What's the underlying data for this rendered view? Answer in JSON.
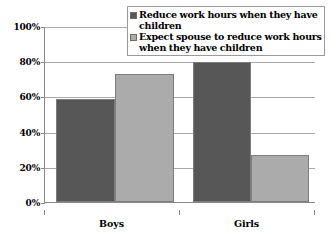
{
  "chart_data": {
    "type": "bar",
    "title": "",
    "subtitle": "",
    "xlabel": "",
    "ylabel": "",
    "categories": [
      "Boys",
      "Girls"
    ],
    "ylim": [
      0,
      100
    ],
    "ytick_labels": [
      "100%",
      "80%",
      "60%",
      "40%",
      "20%",
      "0%"
    ],
    "ytick_values": [
      100,
      80,
      60,
      40,
      20,
      0
    ],
    "grid": true,
    "legend_position": "top-right",
    "series": [
      {
        "name": "Reduce work hours when they have children",
        "color": "#575757",
        "values": [
          59,
          80
        ],
        "value_labels": [
          "59%",
          "80%"
        ]
      },
      {
        "name": "Expect spouse to reduce work hours when they have children",
        "color": "#ababab",
        "values": [
          73,
          27
        ],
        "value_labels": [
          "73%",
          "27%"
        ]
      }
    ],
    "annotations": []
  },
  "legend": {
    "items": [
      {
        "label": "Reduce work hours when they have children",
        "swatch_color": "#575757"
      },
      {
        "label": "Expect spouse to reduce work hours when they have children",
        "swatch_color": "#ababab"
      }
    ]
  },
  "axes": {
    "y": {
      "ticks": [
        {
          "label": "100%",
          "value": 100
        },
        {
          "label": "80%",
          "value": 80
        },
        {
          "label": "60%",
          "value": 60
        },
        {
          "label": "40%",
          "value": 40
        },
        {
          "label": "20%",
          "value": 20
        },
        {
          "label": "0%",
          "value": 0
        }
      ]
    },
    "x": {
      "ticks": [
        {
          "label": "Boys"
        },
        {
          "label": "Girls"
        }
      ]
    }
  },
  "colors": {
    "series_dark": "#575757",
    "series_light": "#ababab",
    "gridline": "#aaaaaa",
    "axis": "#8a8a8a",
    "bar_border": "#7d7d7d",
    "legend_border": "#9a9a9a",
    "background": "#ffffff",
    "text": "#000000"
  }
}
